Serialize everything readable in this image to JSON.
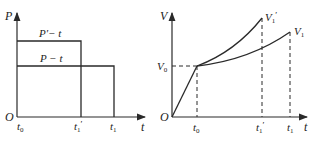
{
  "left_chart": {
    "y_axis_label": "P",
    "x_axis_label": "t",
    "origin_label": "O",
    "series": [
      {
        "name": "P'-t",
        "label": "P′− t",
        "level": "high",
        "end": "t1'"
      },
      {
        "name": "P-t",
        "label": "P − t",
        "level": "low",
        "end": "t1"
      }
    ],
    "x_ticks": [
      "t0",
      "t1'",
      "t1"
    ],
    "x_tick_labels": {
      "t0": "t",
      "t0_sub": "0",
      "t1p": "t",
      "t1p_sub": "1",
      "t1p_prime": "′",
      "t1": "t",
      "t1_sub": "1"
    }
  },
  "right_chart": {
    "y_axis_label": "V",
    "x_axis_label": "t",
    "origin_label": "O",
    "y_tick": {
      "main": "V",
      "sub": "0"
    },
    "curve_labels": {
      "v1p_main": "V",
      "v1p_sub": "1",
      "v1p_prime": "′",
      "v1_main": "V",
      "v1_sub": "1"
    },
    "x_tick_labels": {
      "t0": "t",
      "t0_sub": "0",
      "t1p": "t",
      "t1p_sub": "1",
      "t1p_prime": "′",
      "t1": "t",
      "t1_sub": "1"
    }
  },
  "colors": {
    "line": "#2a2a2a",
    "text": "#222222",
    "background": "#ffffff"
  }
}
